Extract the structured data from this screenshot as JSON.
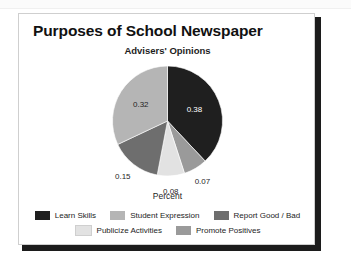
{
  "slide": {
    "title": "Purposes of School Newspaper"
  },
  "chart_data": {
    "type": "pie",
    "title": "Advisers' Opinions",
    "xlabel": "Percent",
    "ylabel": "",
    "legend_position": "bottom",
    "grid": false,
    "categories": [
      "Learn Skills",
      "Student Expression",
      "Report Good / Bad",
      "Publicize Activities",
      "Promote Positives"
    ],
    "values": [
      0.38,
      0.32,
      0.15,
      0.08,
      0.07
    ],
    "colors": [
      "#1f1f1f",
      "#b5b5b5",
      "#6e6e6e",
      "#e2e2e2",
      "#9a9a9a"
    ],
    "slices": [
      {
        "label": "Learn Skills",
        "value": 0.38,
        "value_text": "0.38",
        "color": "#1f1f1f",
        "label_placement": "inside",
        "label_color": "#ffffff"
      },
      {
        "label": "Promote Positives",
        "value": 0.07,
        "value_text": "0.07",
        "color": "#9a9a9a",
        "label_placement": "outside",
        "label_color": "#1f1f1f"
      },
      {
        "label": "Publicize Activities",
        "value": 0.08,
        "value_text": "0.08",
        "color": "#e2e2e2",
        "label_placement": "outside",
        "label_color": "#1f1f1f"
      },
      {
        "label": "Report Good / Bad",
        "value": 0.15,
        "value_text": "0.15",
        "color": "#6e6e6e",
        "label_placement": "outside",
        "label_color": "#1f1f1f"
      },
      {
        "label": "Student Expression",
        "value": 0.32,
        "value_text": "0.32",
        "color": "#b5b5b5",
        "label_placement": "inside",
        "label_color": "#1f1f1f"
      }
    ]
  },
  "legend": {
    "rows": [
      [
        {
          "label": "Learn Skills",
          "color": "#1f1f1f"
        },
        {
          "label": "Student Expression",
          "color": "#b5b5b5"
        },
        {
          "label": "Report Good / Bad",
          "color": "#6e6e6e"
        }
      ],
      [
        {
          "label": "Publicize Activities",
          "color": "#e2e2e2"
        },
        {
          "label": "Promote Positives",
          "color": "#9a9a9a"
        }
      ]
    ]
  }
}
